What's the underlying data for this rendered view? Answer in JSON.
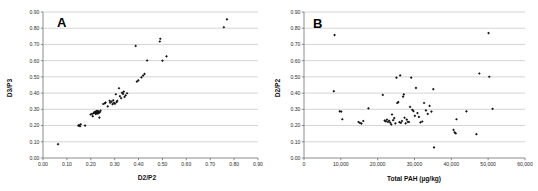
{
  "figure": {
    "title": "",
    "panel_count": 2
  },
  "chart_data": [
    {
      "type": "scatter",
      "panel_label": "A",
      "title": "",
      "xlabel": "D2/P2",
      "ylabel": "D3/P3",
      "xlim": [
        0.0,
        0.9
      ],
      "ylim": [
        0.0,
        0.9
      ],
      "xticks": [
        0.0,
        0.1,
        0.2,
        0.3,
        0.4,
        0.5,
        0.6,
        0.7,
        0.8,
        0.9
      ],
      "yticks": [
        0.0,
        0.1,
        0.2,
        0.3,
        0.4,
        0.5,
        0.6,
        0.7,
        0.8,
        0.9
      ],
      "xtick_labels": [
        "0.00",
        "0.10",
        "0.20",
        "0.30",
        "0.40",
        "0.50",
        "0.60",
        "0.70",
        "0.80",
        "0.90"
      ],
      "ytick_labels": [
        "0.00",
        "0.10",
        "0.20",
        "0.30",
        "0.40",
        "0.50",
        "0.60",
        "0.70",
        "0.80",
        "0.90"
      ],
      "grid": "horizontal",
      "legend": "none",
      "marker": "small filled diamond",
      "marker_color": "#141414",
      "points": [
        [
          0.063,
          0.085
        ],
        [
          0.148,
          0.199
        ],
        [
          0.151,
          0.203
        ],
        [
          0.155,
          0.196
        ],
        [
          0.158,
          0.208
        ],
        [
          0.176,
          0.2
        ],
        [
          0.199,
          0.268
        ],
        [
          0.205,
          0.272
        ],
        [
          0.208,
          0.258
        ],
        [
          0.212,
          0.276
        ],
        [
          0.214,
          0.281
        ],
        [
          0.216,
          0.279
        ],
        [
          0.218,
          0.283
        ],
        [
          0.219,
          0.278
        ],
        [
          0.22,
          0.285
        ],
        [
          0.221,
          0.272
        ],
        [
          0.222,
          0.28
        ],
        [
          0.223,
          0.287
        ],
        [
          0.224,
          0.276
        ],
        [
          0.225,
          0.282
        ],
        [
          0.226,
          0.29
        ],
        [
          0.227,
          0.278
        ],
        [
          0.228,
          0.284
        ],
        [
          0.229,
          0.275
        ],
        [
          0.23,
          0.288
        ],
        [
          0.231,
          0.281
        ],
        [
          0.232,
          0.277
        ],
        [
          0.233,
          0.286
        ],
        [
          0.234,
          0.28
        ],
        [
          0.236,
          0.249
        ],
        [
          0.238,
          0.283
        ],
        [
          0.241,
          0.292
        ],
        [
          0.252,
          0.333
        ],
        [
          0.259,
          0.337
        ],
        [
          0.262,
          0.342
        ],
        [
          0.271,
          0.318
        ],
        [
          0.279,
          0.353
        ],
        [
          0.281,
          0.341
        ],
        [
          0.287,
          0.348
        ],
        [
          0.291,
          0.332
        ],
        [
          0.294,
          0.356
        ],
        [
          0.297,
          0.34
        ],
        [
          0.301,
          0.335
        ],
        [
          0.305,
          0.393
        ],
        [
          0.308,
          0.345
        ],
        [
          0.311,
          0.352
        ],
        [
          0.318,
          0.43
        ],
        [
          0.322,
          0.381
        ],
        [
          0.327,
          0.369
        ],
        [
          0.331,
          0.402
        ],
        [
          0.335,
          0.395
        ],
        [
          0.338,
          0.409
        ],
        [
          0.341,
          0.376
        ],
        [
          0.346,
          0.386
        ],
        [
          0.352,
          0.399
        ],
        [
          0.388,
          0.691
        ],
        [
          0.393,
          0.471
        ],
        [
          0.399,
          0.479
        ],
        [
          0.412,
          0.497
        ],
        [
          0.419,
          0.508
        ],
        [
          0.425,
          0.518
        ],
        [
          0.436,
          0.601
        ],
        [
          0.489,
          0.718
        ],
        [
          0.491,
          0.735
        ],
        [
          0.5,
          0.6
        ],
        [
          0.517,
          0.627
        ],
        [
          0.757,
          0.806
        ],
        [
          0.77,
          0.855
        ]
      ]
    },
    {
      "type": "scatter",
      "panel_label": "B",
      "title": "",
      "xlabel": "Total PAH (µg/kg)",
      "ylabel": "D2/P2",
      "xlim": [
        0,
        60000
      ],
      "ylim": [
        0.0,
        0.9
      ],
      "xticks": [
        0,
        10000,
        20000,
        30000,
        40000,
        50000,
        60000
      ],
      "yticks": [
        0.0,
        0.1,
        0.2,
        0.3,
        0.4,
        0.5,
        0.6,
        0.7,
        0.8,
        0.9
      ],
      "xtick_labels": [
        "0",
        "10,000",
        "20,000",
        "30,000",
        "40,000",
        "50,000",
        "60,000"
      ],
      "ytick_labels": [
        "0.00",
        "0.10",
        "0.20",
        "0.30",
        "0.40",
        "0.50",
        "0.60",
        "0.70",
        "0.80",
        "0.90"
      ],
      "grid": "horizontal",
      "legend": "none",
      "marker": "small filled diamond",
      "marker_color": "#141414",
      "points": [
        [
          8300,
          0.758
        ],
        [
          8100,
          0.412
        ],
        [
          9700,
          0.288
        ],
        [
          10100,
          0.286
        ],
        [
          10400,
          0.239
        ],
        [
          14800,
          0.222
        ],
        [
          15200,
          0.216
        ],
        [
          15600,
          0.212
        ],
        [
          16100,
          0.228
        ],
        [
          17500,
          0.306
        ],
        [
          21400,
          0.389
        ],
        [
          21900,
          0.231
        ],
        [
          22200,
          0.226
        ],
        [
          22500,
          0.236
        ],
        [
          22800,
          0.222
        ],
        [
          23100,
          0.229
        ],
        [
          23400,
          0.218
        ],
        [
          23700,
          0.207
        ],
        [
          23900,
          0.268
        ],
        [
          24200,
          0.233
        ],
        [
          24500,
          0.246
        ],
        [
          24800,
          0.213
        ],
        [
          25100,
          0.495
        ],
        [
          25300,
          0.339
        ],
        [
          25600,
          0.345
        ],
        [
          25900,
          0.221
        ],
        [
          26100,
          0.509
        ],
        [
          26300,
          0.217
        ],
        [
          26600,
          0.228
        ],
        [
          26900,
          0.378
        ],
        [
          27100,
          0.392
        ],
        [
          27300,
          0.248
        ],
        [
          27600,
          0.214
        ],
        [
          27900,
          0.237
        ],
        [
          28200,
          0.223
        ],
        [
          28500,
          0.222
        ],
        [
          28800,
          0.315
        ],
        [
          29100,
          0.495
        ],
        [
          29400,
          0.297
        ],
        [
          29700,
          0.289
        ],
        [
          30100,
          0.26
        ],
        [
          30400,
          0.432
        ],
        [
          30800,
          0.277
        ],
        [
          31200,
          0.253
        ],
        [
          31600,
          0.219
        ],
        [
          32100,
          0.225
        ],
        [
          32600,
          0.339
        ],
        [
          33100,
          0.293
        ],
        [
          33600,
          0.272
        ],
        [
          34100,
          0.321
        ],
        [
          34600,
          0.286
        ],
        [
          35100,
          0.424
        ],
        [
          35300,
          0.065
        ],
        [
          40600,
          0.173
        ],
        [
          40900,
          0.158
        ],
        [
          41200,
          0.152
        ],
        [
          41400,
          0.239
        ],
        [
          44100,
          0.288
        ],
        [
          46800,
          0.147
        ],
        [
          47600,
          0.521
        ],
        [
          50100,
          0.77
        ],
        [
          50300,
          0.501
        ],
        [
          51200,
          0.303
        ]
      ]
    }
  ]
}
